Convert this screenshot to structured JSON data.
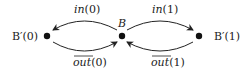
{
  "diagram": {
    "nodes": [
      {
        "id": "Bp0",
        "label": "B′(0)",
        "x": 47,
        "y": 36
      },
      {
        "id": "B",
        "label": "B",
        "x": 122,
        "y": 36
      },
      {
        "id": "Bp1",
        "label": "B′(1)",
        "x": 199,
        "y": 36
      }
    ],
    "edges": [
      {
        "from": "B",
        "to": "Bp0",
        "label": "in(0)",
        "overline": false
      },
      {
        "from": "Bp0",
        "to": "B",
        "label": "out(0)",
        "overline": true
      },
      {
        "from": "B",
        "to": "Bp1",
        "label": "in(1)",
        "overline": false
      },
      {
        "from": "Bp1",
        "to": "B",
        "label": "out(1)",
        "overline": true
      }
    ],
    "labels": {
      "bp0": "B′(0)",
      "b": "B",
      "bp1": "B′(1)",
      "in0_name": "in",
      "in0_arg": "(0)",
      "out0_name": "out",
      "out0_arg": "(0)",
      "in1_name": "in",
      "in1_arg": "(1)",
      "out1_name": "out",
      "out1_arg": "(1)"
    },
    "colors": {
      "ink": "#222222",
      "background": "#ffffff"
    }
  }
}
